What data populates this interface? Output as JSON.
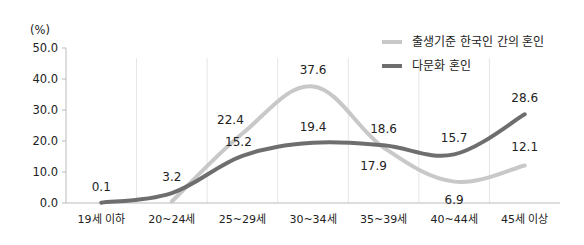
{
  "chart_data": {
    "type": "line",
    "title": "",
    "ylabel": "(%)",
    "xlabel": "",
    "ylim": [
      0,
      50
    ],
    "yticks": [
      "0.0",
      "10.0",
      "20.0",
      "30.0",
      "40.0",
      "50.0"
    ],
    "ytick_values": [
      0,
      10,
      20,
      30,
      40,
      50
    ],
    "categories": [
      "19세 이하",
      "20~24세",
      "25~29세",
      "30~34세",
      "35~39세",
      "40~44세",
      "45세 이상"
    ],
    "grid": "vertical",
    "legend_position": "top-right",
    "series": [
      {
        "name": "출생기준 한국인 간의 혼인",
        "color": "#c8c8c8",
        "values": [
          null,
          0.5,
          22.4,
          37.6,
          17.9,
          6.9,
          12.1
        ],
        "labels": [
          null,
          null,
          "22.4",
          "37.6",
          "17.9",
          "6.9",
          "12.1"
        ]
      },
      {
        "name": "다문화 혼인",
        "color": "#6e6e6e",
        "values": [
          0.1,
          3.2,
          15.2,
          19.4,
          18.6,
          15.7,
          28.6
        ],
        "labels": [
          "0.1",
          "3.2",
          "15.2",
          "19.4",
          "18.6",
          "15.7",
          "28.6"
        ]
      }
    ]
  }
}
